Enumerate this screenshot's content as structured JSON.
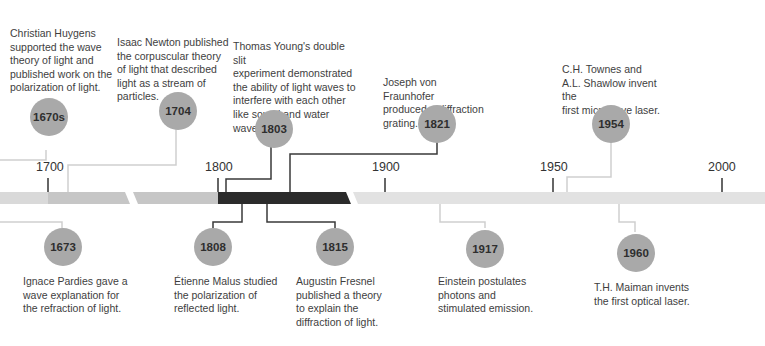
{
  "timeline": {
    "axis_ticks": [
      {
        "label": "1700",
        "x": 48
      },
      {
        "label": "1800",
        "x": 218
      },
      {
        "label": "1900",
        "x": 385
      },
      {
        "label": "1950",
        "x": 553
      },
      {
        "label": "2000",
        "x": 722
      }
    ],
    "bar": {
      "segments": [
        {
          "name": "pre-1700",
          "color": "#d9d9d9"
        },
        {
          "name": "1700-1800 left",
          "color": "#c6c6c6"
        },
        {
          "name": "1700-1800 right",
          "color": "#c6c6c6"
        },
        {
          "name": "1800-1900",
          "color": "#2b2b2b"
        },
        {
          "name": "1900-2000",
          "color": "#e2e2e2"
        }
      ]
    },
    "colors": {
      "circle": "#a9a9a9",
      "connector_dark": "#3a3a3a",
      "connector_light": "#cfcfcf",
      "text": "#3e3e3e"
    },
    "events_above": [
      {
        "year": "1670s",
        "text": "Christian Huygens\nsupported the wave\ntheory of light and\npublished work on the\npolarization of light."
      },
      {
        "year": "1704",
        "text": "Isaac Newton published\nthe corpuscular theory\nof light that described\nlight as a stream of\nparticles."
      },
      {
        "year": "1803",
        "text": "Thomas Young's double slit\nexperiment demonstrated\nthe ability of light waves to\ninterfere with each other\nlike sound and water waves."
      },
      {
        "year": "1821",
        "text": "Joseph von Fraunhofer\nproduced a diffraction\ngrating."
      },
      {
        "year": "1954",
        "text": "C.H. Townes and\nA.L. Shawlow invent the\nfirst microwave laser."
      }
    ],
    "events_below": [
      {
        "year": "1673",
        "text": "Ignace Pardies gave a\nwave explanation for\nthe refraction of light."
      },
      {
        "year": "1808",
        "text": "Étienne Malus studied\nthe polarization of\nreflected light."
      },
      {
        "year": "1815",
        "text": "Augustin Fresnel\npublished a theory\nto explain the\ndiffraction of light."
      },
      {
        "year": "1917",
        "text": "Einstein postulates\nphotons and\nstimulated emission."
      },
      {
        "year": "1960",
        "text": "T.H. Maiman invents\nthe first optical laser."
      }
    ]
  }
}
